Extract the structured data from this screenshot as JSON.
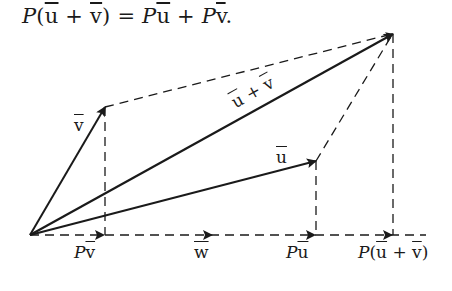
{
  "equation": {
    "text": "P(ū + v̄) = Pū + Pv̄.",
    "parts": {
      "p1": "P",
      "open": "(",
      "u": "u",
      "plus1": " + ",
      "v": "v",
      "close": ")",
      "eq": " = ",
      "p2": "P",
      "u2": "u",
      "plus2": " + ",
      "p3": "P",
      "v2": "v",
      "period": "."
    }
  },
  "labels": {
    "v": "v",
    "u_plus_v": {
      "u": "u",
      "plus": " + ",
      "v": "v"
    },
    "u": "u",
    "Pv": {
      "P": "P",
      "v": "v"
    },
    "w": "w",
    "Pu": {
      "P": "P",
      "u": "u"
    },
    "Puv": {
      "P": "P",
      "open": "(",
      "u": "u",
      "plus": " + ",
      "v": "v",
      "close": ")"
    }
  },
  "geometry": {
    "origin": [
      30,
      235
    ],
    "v_tip": [
      105,
      107
    ],
    "u_tip": [
      316,
      161
    ],
    "sum_tip": [
      393,
      34
    ],
    "Pv_point": [
      105,
      235
    ],
    "Pu_point": [
      316,
      235
    ],
    "Psum_point": [
      393,
      235
    ],
    "w_arrow_tip": [
      212,
      235
    ],
    "axis_end": [
      426,
      235
    ]
  },
  "colors": {
    "ink": "#1a1a1a",
    "background": "#ffffff"
  }
}
